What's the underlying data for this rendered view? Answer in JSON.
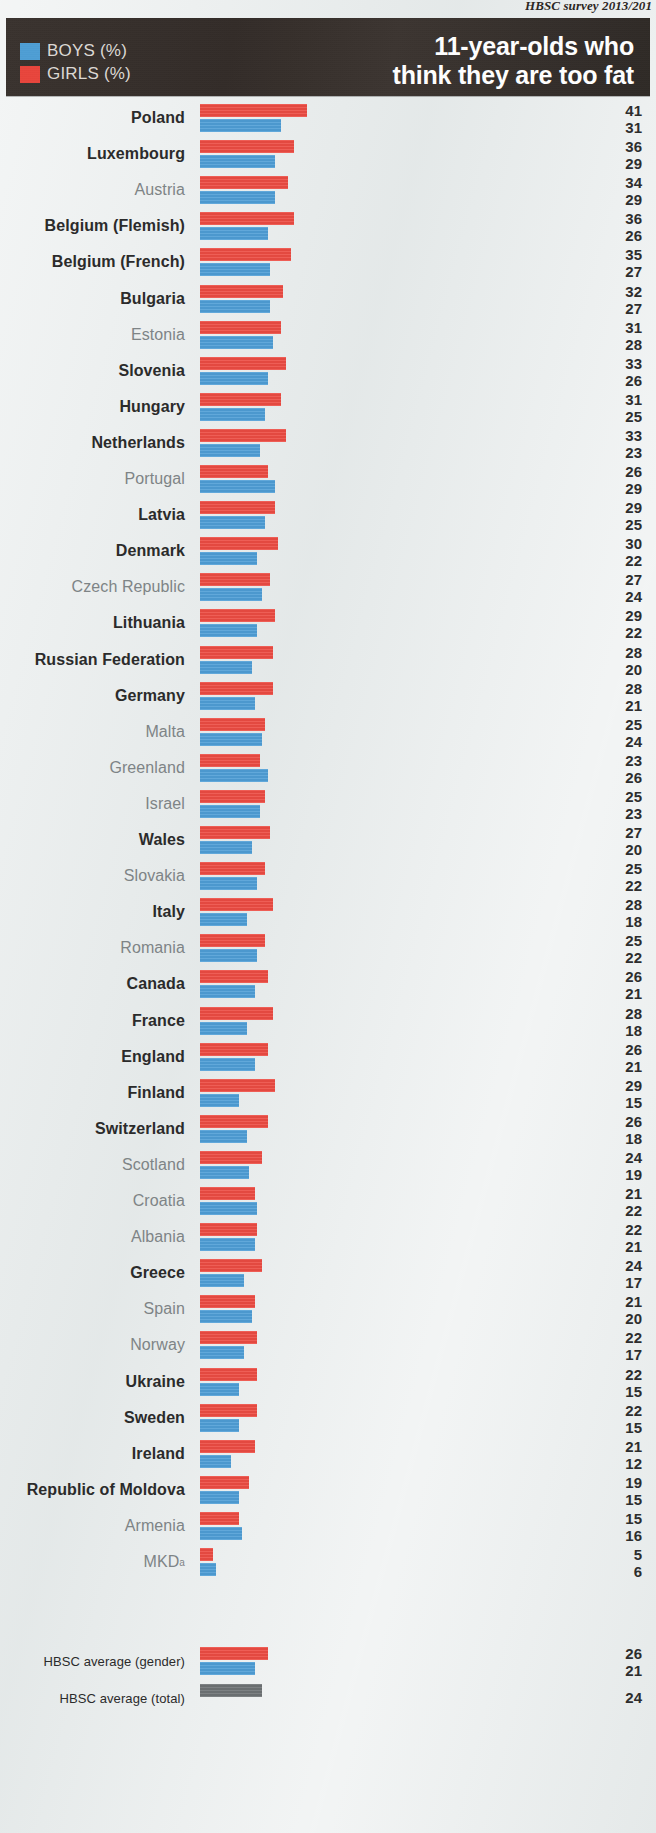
{
  "source_note": "HBSC survey 2013/201",
  "header": {
    "title_line1": "11-year-olds who",
    "title_line2": "think they are too fat",
    "legend": [
      {
        "key": "boys",
        "label": "BOYS (%)",
        "color": "#4e9ed4"
      },
      {
        "key": "girls",
        "label": "GIRLS (%)",
        "color": "#e8453c"
      }
    ]
  },
  "footnote_marker": "a",
  "chart_data": {
    "type": "bar",
    "orientation": "horizontal",
    "title": "11-year-olds who think they are too fat",
    "subtitle": "HBSC survey 2013/201",
    "xlabel": "",
    "ylabel": "",
    "xlim": [
      0,
      45
    ],
    "grid": false,
    "legend_position": "top-left",
    "series": [
      {
        "name": "GIRLS (%)",
        "color": "#ec4c43"
      },
      {
        "name": "BOYS (%)",
        "color": "#4f9ed6"
      }
    ],
    "categories": [
      "Poland",
      "Luxembourg",
      "Austria",
      "Belgium (Flemish)",
      "Belgium (French)",
      "Bulgaria",
      "Estonia",
      "Slovenia",
      "Hungary",
      "Netherlands",
      "Portugal",
      "Latvia",
      "Denmark",
      "Czech Republic",
      "Lithuania",
      "Russian Federation",
      "Germany",
      "Malta",
      "Greenland",
      "Israel",
      "Wales",
      "Slovakia",
      "Italy",
      "Romania",
      "Canada",
      "France",
      "England",
      "Finland",
      "Switzerland",
      "Scotland",
      "Croatia",
      "Albania",
      "Greece",
      "Spain",
      "Norway",
      "Ukraine",
      "Sweden",
      "Ireland",
      "Republic of Moldova",
      "Armenia",
      "MKD"
    ],
    "girls": [
      41,
      36,
      34,
      36,
      35,
      32,
      31,
      33,
      31,
      33,
      26,
      29,
      30,
      27,
      29,
      28,
      28,
      25,
      23,
      25,
      27,
      25,
      28,
      25,
      26,
      28,
      26,
      29,
      26,
      24,
      21,
      22,
      24,
      21,
      22,
      22,
      22,
      21,
      19,
      15,
      5
    ],
    "boys": [
      31,
      29,
      29,
      26,
      27,
      27,
      28,
      26,
      25,
      23,
      29,
      25,
      22,
      24,
      22,
      20,
      21,
      24,
      26,
      23,
      20,
      22,
      18,
      22,
      21,
      18,
      21,
      15,
      18,
      19,
      22,
      21,
      17,
      20,
      17,
      15,
      15,
      12,
      15,
      16,
      6
    ],
    "highlighted": [
      true,
      true,
      false,
      true,
      true,
      true,
      false,
      true,
      true,
      true,
      false,
      true,
      true,
      false,
      true,
      true,
      true,
      false,
      false,
      false,
      true,
      false,
      true,
      false,
      true,
      true,
      true,
      true,
      true,
      false,
      false,
      false,
      true,
      false,
      false,
      true,
      true,
      true,
      true,
      false,
      false
    ],
    "averages": [
      {
        "label": "HBSC average (gender)",
        "girls": 26,
        "boys": 21
      },
      {
        "label": "HBSC average (total)",
        "total": 24
      }
    ]
  }
}
